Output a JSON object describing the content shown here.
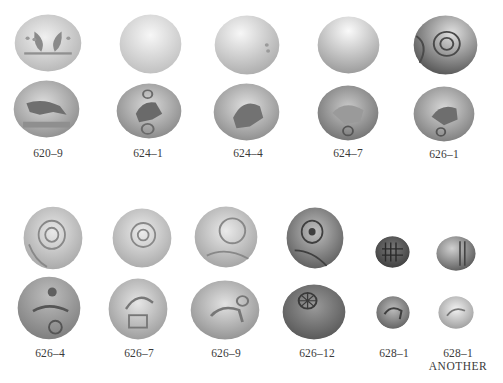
{
  "plate": {
    "rows": [
      {
        "items": [
          {
            "label": "620–9",
            "obverse_tone": "light",
            "reverse_tone": "medium",
            "obverse_motif": "crescents",
            "reverse_motif": "horse"
          },
          {
            "label": "624–1",
            "obverse_tone": "pale",
            "reverse_tone": "medium",
            "obverse_motif": "plain",
            "reverse_motif": "horse-wheel"
          },
          {
            "label": "624–4",
            "obverse_tone": "pale",
            "reverse_tone": "medium",
            "obverse_motif": "plain",
            "reverse_motif": "horse"
          },
          {
            "label": "624–7",
            "obverse_tone": "pale",
            "reverse_tone": "dark",
            "obverse_motif": "plain",
            "reverse_motif": "horse-wheel"
          },
          {
            "label": "626–1",
            "obverse_tone": "dark",
            "reverse_tone": "medium",
            "obverse_motif": "rosette",
            "reverse_motif": "horse"
          }
        ]
      },
      {
        "items": [
          {
            "label": "626–4",
            "obverse_tone": "light",
            "reverse_tone": "medium",
            "obverse_motif": "rosette",
            "reverse_motif": "horse-wheel"
          },
          {
            "label": "626–7",
            "obverse_tone": "light",
            "reverse_tone": "light",
            "obverse_motif": "rosette",
            "reverse_motif": "horse-wheel"
          },
          {
            "label": "626–9",
            "obverse_tone": "light",
            "reverse_tone": "light",
            "obverse_motif": "rosette",
            "reverse_motif": "horse"
          },
          {
            "label": "626–12",
            "obverse_tone": "dark",
            "reverse_tone": "dark",
            "obverse_motif": "rosette",
            "reverse_motif": "wheel"
          },
          {
            "label": "628–1",
            "obverse_tone": "dark",
            "reverse_tone": "medium",
            "obverse_motif": "grid",
            "reverse_motif": "horse"
          },
          {
            "label": "628–1",
            "sublabel": "ANOTHER",
            "obverse_tone": "medium",
            "reverse_tone": "pale",
            "obverse_motif": "lines",
            "reverse_motif": "horse"
          }
        ]
      }
    ]
  },
  "colors": {
    "background": "#ffffff",
    "label_text": "#3a3a3a",
    "coin_pale": "#e4e4e4",
    "coin_light": "#cfcfcf",
    "coin_medium": "#a9a9a9",
    "coin_dark": "#6e6e6e"
  }
}
